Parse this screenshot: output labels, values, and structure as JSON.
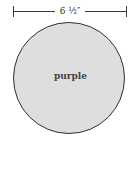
{
  "dimension": {
    "label": "6 ½″"
  },
  "circle": {
    "label": "purple",
    "fill": "#dedede",
    "stroke": "#2f2f2f"
  }
}
